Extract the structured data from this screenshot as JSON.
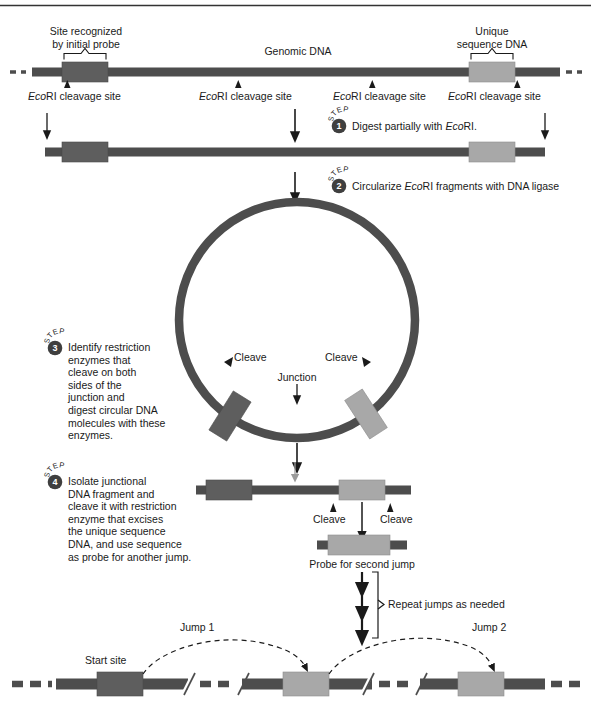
{
  "figure": {
    "colors": {
      "backbone_dark": "#4d4d4d",
      "probe_block": "#5e5e5e",
      "unique_block": "#a8a8a8",
      "badge": "#3f3f3f",
      "text": "#1a1a1a",
      "rule": "#333333"
    }
  },
  "top_rule": {
    "visible": true
  },
  "row1": {
    "label_left": {
      "line1": "Site recognized",
      "line2": "by initial probe"
    },
    "label_center": "Genomic DNA",
    "label_right": {
      "line1": "Unique",
      "line2": "sequence DNA"
    },
    "cleavage_sites": [
      {
        "prefix": "Eco",
        "rest": "RI cleavage site"
      },
      {
        "prefix": "Eco",
        "rest": "RI cleavage site"
      },
      {
        "prefix": "Eco",
        "rest": "RI cleavage site"
      },
      {
        "prefix": "Eco",
        "rest": "RI cleavage site"
      }
    ]
  },
  "steps": [
    {
      "number": "1",
      "arc": "STEP",
      "text": "Digest partially with EcoRI.",
      "text_italic_prefix": "Digest partially with ",
      "text_italic": "Eco",
      "text_tail": "RI."
    },
    {
      "number": "2",
      "arc": "STEP",
      "text": "Circularize EcoRI fragments with DNA ligase",
      "text_italic_prefix": "Circularize ",
      "text_italic": "Eco",
      "text_tail": "RI fragments with DNA ligase"
    },
    {
      "number": "3",
      "arc": "STEP",
      "lines": [
        "Identify restriction",
        "enzymes that",
        "cleave on both",
        "sides of the",
        "junction and",
        "digest circular DNA",
        "molecules with these",
        "enzymes."
      ]
    },
    {
      "number": "4",
      "arc": "STEP",
      "lines": [
        "Isolate junctional",
        "DNA fragment and",
        "cleave it with restriction",
        "enzyme that excises",
        "the unique sequence",
        "DNA, and use sequence",
        "as probe for another jump."
      ]
    }
  ],
  "circle": {
    "cleave_left": "Cleave",
    "cleave_right": "Cleave",
    "junction": "Junction"
  },
  "fragment": {
    "cleave_left": "Cleave",
    "cleave_right": "Cleave"
  },
  "probe": {
    "caption": "Probe for second jump"
  },
  "repeat": {
    "caption": "Repeat jumps as needed",
    "arrow_count": 3
  },
  "bottom": {
    "start_site": "Start site",
    "jump1": "Jump 1",
    "jump2": "Jump 2"
  }
}
